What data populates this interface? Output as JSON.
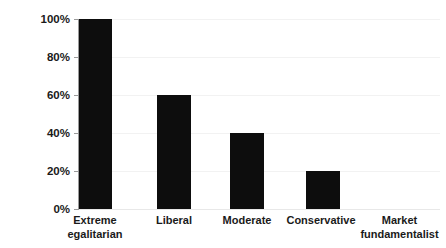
{
  "chart_data": {
    "type": "bar",
    "title": "",
    "subtitle": "",
    "xlabel": "",
    "ylabel": "",
    "categories": [
      "Extreme egalitarian",
      "Liberal",
      "Moderate",
      "Conservative",
      "Market fundamentalist"
    ],
    "category_lines": [
      [
        "Extreme",
        "egalitarian"
      ],
      [
        "Liberal"
      ],
      [
        "Moderate"
      ],
      [
        "Conservative"
      ],
      [
        "Market",
        "fundamentalist"
      ]
    ],
    "values": [
      100,
      60,
      40,
      20,
      0
    ],
    "value_labels": [
      "100%",
      "60%",
      "40%",
      "20%",
      "0%"
    ],
    "ylim": [
      0,
      100
    ],
    "ytick_values": [
      0,
      20,
      40,
      60,
      80,
      100
    ],
    "ytick_labels": [
      "0%",
      "20%",
      "40%",
      "60%",
      "80%",
      "100%"
    ],
    "grid": true,
    "grid_axis": "y",
    "legend": false,
    "legend_position": "none",
    "bar_color": "#0d0d0d",
    "gridline_color": "#f2f2f2",
    "axis_color": "#9a9a9a",
    "background_color": "#ffffff",
    "text_color": "#1a1a1a",
    "series": [
      {
        "name": "",
        "values": [
          100,
          60,
          40,
          20,
          0
        ]
      }
    ],
    "annotations": []
  }
}
